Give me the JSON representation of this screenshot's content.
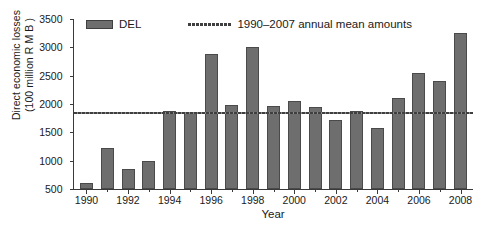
{
  "chart_data": {
    "type": "bar",
    "title": "",
    "xlabel": "Year",
    "ylabel_line1": "Direct economic losses",
    "ylabel_line2": "(100 million R M B )",
    "categories": [
      1990,
      1991,
      1992,
      1993,
      1994,
      1995,
      1996,
      1997,
      1998,
      1999,
      2000,
      2001,
      2002,
      2003,
      2004,
      2005,
      2006,
      2007,
      2008
    ],
    "series": [
      {
        "name": "DEL",
        "values": [
          610,
          1220,
          850,
          990,
          1870,
          1840,
          2890,
          1985,
          3010,
          1965,
          2050,
          1950,
          1715,
          1885,
          1570,
          2105,
          2540,
          2400,
          3250
        ],
        "color": "#6e6e6e",
        "edge_color": "#4a4a4a"
      }
    ],
    "reference_line": {
      "name": "1990–2007 annual mean amounts",
      "value": 1840,
      "style": "dashed",
      "color": "#3f3f3f"
    },
    "ylim": [
      500,
      3500
    ],
    "yticks": [
      500,
      1000,
      1500,
      2000,
      2500,
      3000,
      3500
    ],
    "ytick_labels": [
      "500",
      "1000",
      "1500",
      "2000",
      "2500",
      "3000",
      "3500"
    ],
    "xlim": [
      1989.4,
      2008.6
    ],
    "xticks_major": [
      1990,
      1992,
      1994,
      1996,
      1998,
      2000,
      2002,
      2004,
      2006,
      2008
    ],
    "xtick_labels": [
      "1990",
      "1992",
      "1994",
      "1996",
      "1998",
      "2000",
      "2002",
      "2004",
      "2006",
      "2008"
    ],
    "xticks_minor": [
      1991,
      1993,
      1995,
      1997,
      1999,
      2001,
      2003,
      2005,
      2007
    ],
    "grid": false,
    "legend_position": "top-inside",
    "legend_entries": [
      "DEL",
      "1990–2007 annual mean amounts"
    ]
  }
}
